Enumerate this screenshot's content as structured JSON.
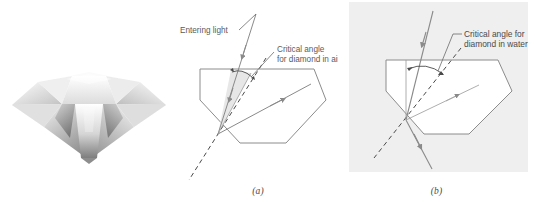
{
  "figure": {
    "subpanels": [
      {
        "id": "photo",
        "caption": ""
      },
      {
        "id": "a",
        "caption": "(a)"
      },
      {
        "id": "b",
        "caption": "(b)"
      }
    ]
  },
  "photo": {
    "alt_name": "cut-diamond-illustration",
    "description": "Grayscale illustration of a brilliant-cut diamond viewed from the side"
  },
  "panel_a": {
    "caption": "(a)",
    "labels": {
      "entering_light": "Entering light",
      "critical_angle_line1": "Critical angle",
      "critical_angle_line2": "for diamond in air"
    },
    "medium": "air",
    "background": "#ffffff",
    "gem_fill": "#ffffff",
    "ray_behavior": "total internal reflection"
  },
  "panel_b": {
    "caption": "(b)",
    "labels": {
      "critical_angle_line1": "Critical angle for",
      "critical_angle_line2": "diamond in water"
    },
    "medium": "water",
    "background": "#efefef",
    "gem_fill": "#ffffff",
    "ray_behavior": "refracted out through bottom facet"
  },
  "colors": {
    "gem_outline": "#8c8c8c",
    "ray": "#8a8a8a",
    "ray_dark": "#6f6f6f",
    "dashed_normal": "#4a4a4a",
    "leader": "#6b6b6b",
    "wedge_fill": "#e2e2e2",
    "text": "#555555",
    "panel_b_background": "#efefef"
  }
}
